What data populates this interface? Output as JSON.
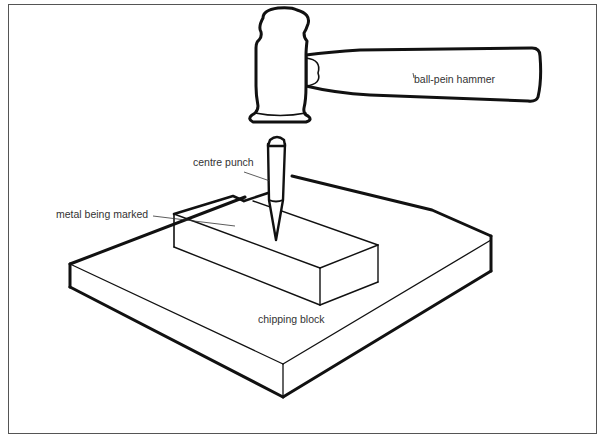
{
  "diagram": {
    "labels": {
      "hammer": "ball-pein hammer",
      "punch": "centre punch",
      "metal": "metal being marked",
      "block": "chipping block"
    },
    "components": [
      "ball-pein hammer",
      "centre punch",
      "metal being marked",
      "chipping block"
    ],
    "colors": {
      "ink": "#111111",
      "frame": "#555555",
      "leader": "#333333",
      "background": "#ffffff"
    }
  }
}
